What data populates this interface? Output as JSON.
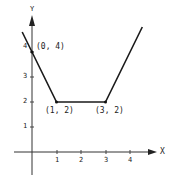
{
  "chart_data": {
    "type": "line",
    "title": "",
    "xlabel": "X",
    "ylabel": "Y",
    "x_ticks": [
      "1",
      "2",
      "3",
      "4"
    ],
    "y_ticks": [
      "1",
      "2",
      "3",
      "4"
    ],
    "xlim": [
      -0.5,
      5
    ],
    "ylim": [
      -0.6,
      6
    ],
    "grid": false,
    "series": [
      {
        "name": "piecewise",
        "x": [
          -0.4,
          0,
          1,
          3,
          4.5
        ],
        "y": [
          4.8,
          4,
          2,
          2,
          5
        ]
      }
    ],
    "annotations": [
      {
        "text": "(0, 4)",
        "x": 0,
        "y": 4
      },
      {
        "text": "(1, 2)",
        "x": 1,
        "y": 2
      },
      {
        "text": "(3, 2)",
        "x": 3,
        "y": 2
      }
    ]
  }
}
